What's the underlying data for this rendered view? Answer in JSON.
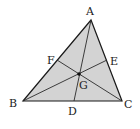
{
  "diagram": {
    "type": "triangle-centroid",
    "fill_color": "#d3d3d3",
    "stroke_color": "#1a1a1a",
    "points": {
      "A": {
        "x": 91,
        "y": 20
      },
      "B": {
        "x": 23,
        "y": 101
      },
      "C": {
        "x": 122,
        "y": 101
      },
      "D": {
        "x": 74,
        "y": 101
      },
      "E": {
        "x": 107,
        "y": 60
      },
      "F": {
        "x": 57,
        "y": 60
      },
      "G": {
        "x": 79,
        "y": 74
      }
    },
    "labels": {
      "A": "A",
      "B": "B",
      "C": "C",
      "D": "D",
      "E": "E",
      "F": "F",
      "G": "G"
    },
    "segments": [
      {
        "from": "A",
        "to": "D",
        "name": "median-ad"
      },
      {
        "from": "B",
        "to": "E",
        "name": "median-be"
      },
      {
        "from": "C",
        "to": "F",
        "name": "median-cf"
      }
    ]
  }
}
